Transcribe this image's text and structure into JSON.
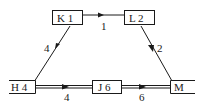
{
  "diagram": {
    "type": "network",
    "nodes": [
      {
        "id": "K",
        "label": "K 1",
        "x": 52,
        "y": 12,
        "w": 30,
        "h": 14,
        "style": "box"
      },
      {
        "id": "L",
        "label": "L 2",
        "x": 124,
        "y": 12,
        "w": 31,
        "h": 14,
        "style": "box"
      },
      {
        "id": "H",
        "label": "H 4",
        "x": 10,
        "y": 80,
        "w": 25,
        "h": 13,
        "style": "open-left"
      },
      {
        "id": "J",
        "label": "J 6",
        "x": 92,
        "y": 80,
        "w": 30,
        "h": 13,
        "style": "box"
      },
      {
        "id": "M",
        "label": "M",
        "x": 170,
        "y": 80,
        "w": 20,
        "h": 13,
        "style": "open-right"
      }
    ],
    "edges": [
      {
        "from": "K",
        "to": "L",
        "label": "1",
        "style": "single"
      },
      {
        "from": "H",
        "to": "K",
        "label": "4",
        "style": "single"
      },
      {
        "from": "L",
        "to": "M",
        "label": "2",
        "style": "single"
      },
      {
        "from": "H",
        "to": "J",
        "label": "4",
        "style": "double"
      },
      {
        "from": "J",
        "to": "M",
        "label": "6",
        "style": "double"
      }
    ],
    "colors": {
      "line": "#1a1a1a",
      "background": "#ffffff"
    }
  }
}
